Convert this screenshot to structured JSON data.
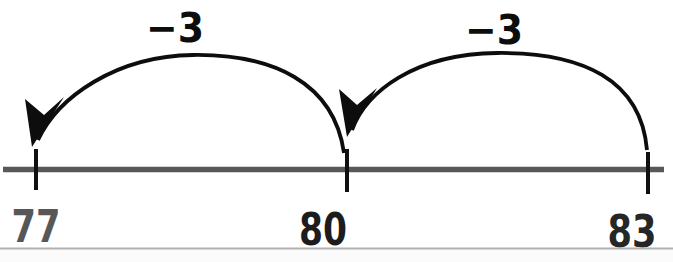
{
  "figure": {
    "type": "number-line-jump-diagram",
    "number_line": {
      "tick_values": [
        "77",
        "80",
        "83"
      ]
    },
    "ticks": [
      {
        "value": "77",
        "color": "#575757"
      },
      {
        "value": "80",
        "color": "#1c1c1c"
      },
      {
        "value": "83",
        "color": "#262626"
      }
    ],
    "jumps": [
      {
        "label": "−3",
        "from": "80",
        "to": "77"
      },
      {
        "label": "−3",
        "from": "83",
        "to": "80"
      }
    ],
    "colors": {
      "background": "#ffffff",
      "line": "#585858",
      "tick": "#101010",
      "arc": "#0d0d0d",
      "jump_label": "#0d0d0d",
      "bottom_rule": "#b0b0b0",
      "below_rule": "#fbfbfb"
    }
  }
}
